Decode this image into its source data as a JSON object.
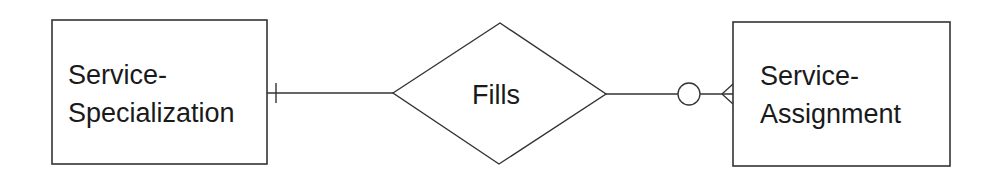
{
  "diagram": {
    "type": "entity-relationship",
    "entities": [
      {
        "id": "left",
        "label_line1": "Service-",
        "label_line2": "Specialization",
        "cardinality": "one (mandatory bar)"
      },
      {
        "id": "right",
        "label_line1": "Service-",
        "label_line2": "Assignment",
        "cardinality": "zero-or-many (circle + crow's foot)"
      }
    ],
    "relationship": {
      "label": "Fills"
    },
    "colors": {
      "stroke": "#333333",
      "text": "#1a1a1a",
      "background": "#ffffff"
    }
  }
}
